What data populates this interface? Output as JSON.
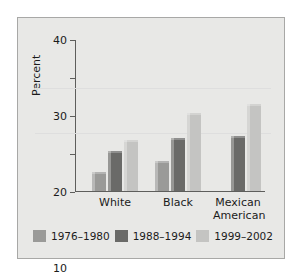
{
  "chart_data": {
    "type": "bar",
    "title": "",
    "subtitle": "",
    "xlabel": "",
    "ylabel": "Percent",
    "ylim": [
      0,
      40
    ],
    "yticks": [
      0,
      10,
      20,
      30,
      40
    ],
    "ytick_labels": [
      "0",
      "10",
      "20",
      "30",
      "40"
    ],
    "grid": false,
    "legend_position": "bottom",
    "categories": [
      "White",
      "Black",
      "Mexican American"
    ],
    "category_labels": [
      "White",
      "Black",
      "Mexican\nAmerican"
    ],
    "series": [
      {
        "name": "1976–1980",
        "color": "#9a9a98",
        "values": [
          5,
          8,
          null
        ]
      },
      {
        "name": "1988–1994",
        "color": "#6a6a68",
        "values": [
          10.5,
          14,
          14.5
        ]
      },
      {
        "name": "1999–2002",
        "color": "#c4c4c2",
        "values": [
          13.5,
          20.5,
          23
        ]
      }
    ]
  },
  "axis": {
    "y_title": "Percent",
    "ticks": [
      {
        "value": 40,
        "label": "40"
      },
      {
        "value": 30,
        "label": "30"
      },
      {
        "value": 20,
        "label": "20"
      },
      {
        "value": 10,
        "label": "10"
      },
      {
        "value": 0,
        "label": "0"
      }
    ]
  },
  "categories": [
    {
      "label": "White"
    },
    {
      "label": "Black"
    },
    {
      "label": "Mexican\nAmerican"
    }
  ],
  "legend": {
    "items": [
      {
        "label": "1976–1980",
        "color": "#9a9a98"
      },
      {
        "label": "1988–1994",
        "color": "#6a6a68"
      },
      {
        "label": "1999–2002",
        "color": "#c4c4c2"
      }
    ]
  },
  "colors": {
    "figure_background": "#e8e8e6",
    "figure_border": "#a8a8a6",
    "axis": "#5e5e5c",
    "text": "#1b1b1b",
    "series_1976_1980": "#9a9a98",
    "series_1988_1994": "#6a6a68",
    "series_1999_2002": "#c4c4c2"
  }
}
